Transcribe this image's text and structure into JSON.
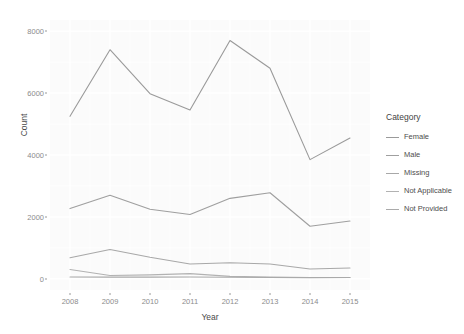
{
  "chart_data": {
    "type": "line",
    "title": "",
    "xlabel": "Year",
    "ylabel": "Count",
    "x": [
      2008,
      2009,
      2010,
      2011,
      2012,
      2013,
      2014,
      2015
    ],
    "xticklabels": [
      "2008",
      "2009",
      "2010",
      "2011",
      "2012",
      "2013",
      "2014",
      "2015"
    ],
    "yticks": [
      0,
      2000,
      4000,
      6000,
      8000
    ],
    "yticklabels": [
      "0",
      "2000",
      "4000",
      "6000",
      "8000"
    ],
    "ylim": [
      0,
      8000
    ],
    "xlim": [
      2008,
      2015
    ],
    "grid": true,
    "legend_position": "right",
    "legend_title": "Category",
    "series": [
      {
        "name": "Female",
        "color": "#9a9a9a",
        "values": [
          5250,
          7400,
          5980,
          5450,
          7700,
          6800,
          3850,
          4550
        ]
      },
      {
        "name": "Male",
        "color": "#9f9f9f",
        "values": [
          2270,
          2700,
          2250,
          2080,
          2600,
          2780,
          1700,
          1870
        ]
      },
      {
        "name": "Missing",
        "color": "#a8a8a8",
        "values": [
          680,
          950,
          700,
          480,
          520,
          480,
          320,
          350
        ]
      },
      {
        "name": "Not Applicable",
        "color": "#b2b2b2",
        "values": [
          300,
          110,
          130,
          170,
          80,
          55,
          45,
          45
        ]
      },
      {
        "name": "Not Provided",
        "color": "#aaaaaa",
        "values": [
          60,
          55,
          55,
          60,
          50,
          45,
          40,
          45
        ]
      }
    ]
  },
  "panel": {
    "background": "#fbfbfb",
    "gridline_color": "#ffffff"
  }
}
